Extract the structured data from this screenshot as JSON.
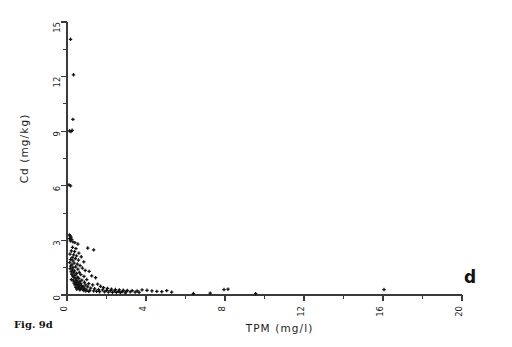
{
  "figure": {
    "caption": "Fig. 9d",
    "panel_letter": "d"
  },
  "chart_data": {
    "type": "scatter",
    "title": "",
    "xlabel": "TPM  (mg/l)",
    "ylabel": "Cd  (mg/kg)",
    "xlim": [
      0,
      20
    ],
    "ylim": [
      0,
      15
    ],
    "x_major_ticks": [
      0,
      4,
      8,
      12,
      16,
      20
    ],
    "x_minor_ticks": [
      2,
      6,
      10,
      14,
      18
    ],
    "y_major_ticks": [
      0,
      3,
      6,
      9,
      12,
      15
    ],
    "y_minor_ticks": [
      1.5,
      4.5,
      7.5,
      10.5,
      13.5
    ],
    "x_tick_labels": [
      "0",
      "4",
      "8",
      "12",
      "16",
      "20"
    ],
    "y_tick_labels": [
      "0",
      "3",
      "6",
      "9",
      "12",
      "15"
    ],
    "tick_label_rotation": 90,
    "grid": false,
    "legend": null,
    "marker": "cross",
    "marker_color": "#111111",
    "points": [
      [
        0.18,
        14.05
      ],
      [
        0.33,
        12.1
      ],
      [
        0.3,
        9.65
      ],
      [
        0.12,
        9.02
      ],
      [
        0.2,
        8.98
      ],
      [
        0.26,
        9.05
      ],
      [
        0.1,
        6.05
      ],
      [
        0.18,
        6.0
      ],
      [
        0.12,
        3.3
      ],
      [
        0.16,
        3.25
      ],
      [
        0.2,
        3.18
      ],
      [
        0.13,
        3.1
      ],
      [
        0.24,
        3.05
      ],
      [
        0.17,
        2.98
      ],
      [
        0.3,
        2.92
      ],
      [
        0.4,
        2.88
      ],
      [
        0.55,
        2.8
      ],
      [
        0.28,
        2.62
      ],
      [
        0.45,
        2.55
      ],
      [
        1.05,
        2.58
      ],
      [
        1.35,
        2.48
      ],
      [
        0.22,
        2.42
      ],
      [
        0.38,
        2.38
      ],
      [
        0.6,
        2.3
      ],
      [
        0.15,
        2.25
      ],
      [
        0.33,
        2.2
      ],
      [
        0.48,
        2.15
      ],
      [
        0.72,
        2.1
      ],
      [
        0.26,
        2.05
      ],
      [
        0.42,
        2.0
      ],
      [
        0.18,
        1.95
      ],
      [
        0.58,
        1.92
      ],
      [
        0.3,
        1.88
      ],
      [
        0.85,
        1.82
      ],
      [
        0.14,
        1.78
      ],
      [
        0.36,
        1.75
      ],
      [
        0.52,
        1.7
      ],
      [
        0.25,
        1.66
      ],
      [
        0.66,
        1.62
      ],
      [
        0.19,
        1.58
      ],
      [
        0.44,
        1.55
      ],
      [
        0.31,
        1.5
      ],
      [
        0.78,
        1.48
      ],
      [
        0.16,
        1.45
      ],
      [
        0.55,
        1.42
      ],
      [
        0.27,
        1.38
      ],
      [
        0.92,
        1.35
      ],
      [
        0.38,
        1.32
      ],
      [
        0.21,
        1.28
      ],
      [
        0.62,
        1.25
      ],
      [
        0.34,
        1.22
      ],
      [
        0.48,
        1.18
      ],
      [
        1.12,
        1.3
      ],
      [
        0.24,
        1.15
      ],
      [
        0.7,
        1.12
      ],
      [
        0.4,
        1.08
      ],
      [
        0.29,
        1.05
      ],
      [
        0.86,
        1.02
      ],
      [
        0.52,
        0.98
      ],
      [
        0.35,
        0.95
      ],
      [
        1.25,
        1.05
      ],
      [
        0.6,
        0.92
      ],
      [
        0.44,
        0.88
      ],
      [
        0.22,
        0.85
      ],
      [
        0.75,
        0.82
      ],
      [
        0.5,
        0.8
      ],
      [
        0.32,
        0.78
      ],
      [
        1.0,
        0.85
      ],
      [
        0.65,
        0.75
      ],
      [
        0.42,
        0.72
      ],
      [
        0.88,
        0.7
      ],
      [
        0.55,
        0.68
      ],
      [
        0.36,
        0.65
      ],
      [
        1.45,
        0.95
      ],
      [
        0.7,
        0.62
      ],
      [
        0.48,
        0.6
      ],
      [
        1.1,
        0.62
      ],
      [
        0.6,
        0.58
      ],
      [
        0.4,
        0.55
      ],
      [
        0.95,
        0.55
      ],
      [
        0.72,
        0.52
      ],
      [
        0.52,
        0.5
      ],
      [
        1.3,
        0.55
      ],
      [
        0.82,
        0.48
      ],
      [
        0.62,
        0.45
      ],
      [
        1.55,
        0.6
      ],
      [
        0.45,
        0.42
      ],
      [
        1.05,
        0.45
      ],
      [
        0.75,
        0.4
      ],
      [
        0.58,
        0.38
      ],
      [
        1.7,
        0.48
      ],
      [
        0.9,
        0.36
      ],
      [
        0.68,
        0.34
      ],
      [
        1.2,
        0.38
      ],
      [
        0.5,
        0.32
      ],
      [
        1.85,
        0.4
      ],
      [
        0.8,
        0.3
      ],
      [
        1.4,
        0.34
      ],
      [
        0.65,
        0.28
      ],
      [
        2.05,
        0.36
      ],
      [
        1.0,
        0.27
      ],
      [
        1.6,
        0.3
      ],
      [
        0.85,
        0.25
      ],
      [
        2.25,
        0.32
      ],
      [
        1.15,
        0.24
      ],
      [
        1.8,
        0.28
      ],
      [
        0.95,
        0.22
      ],
      [
        2.45,
        0.3
      ],
      [
        1.35,
        0.22
      ],
      [
        2.0,
        0.26
      ],
      [
        1.1,
        0.2
      ],
      [
        2.65,
        0.28
      ],
      [
        1.5,
        0.2
      ],
      [
        2.2,
        0.24
      ],
      [
        2.85,
        0.26
      ],
      [
        1.65,
        0.18
      ],
      [
        2.4,
        0.22
      ],
      [
        3.05,
        0.25
      ],
      [
        1.9,
        0.17
      ],
      [
        2.6,
        0.2
      ],
      [
        3.3,
        0.24
      ],
      [
        2.1,
        0.16
      ],
      [
        2.8,
        0.19
      ],
      [
        3.55,
        0.22
      ],
      [
        2.3,
        0.15
      ],
      [
        3.0,
        0.18
      ],
      [
        3.8,
        0.28
      ],
      [
        2.5,
        0.14
      ],
      [
        3.2,
        0.17
      ],
      [
        4.05,
        0.26
      ],
      [
        2.7,
        0.13
      ],
      [
        3.45,
        0.16
      ],
      [
        4.3,
        0.22
      ],
      [
        2.95,
        0.12
      ],
      [
        3.65,
        0.15
      ],
      [
        4.55,
        0.2
      ],
      [
        4.8,
        0.18
      ],
      [
        5.05,
        0.24
      ],
      [
        5.3,
        0.16
      ],
      [
        6.4,
        0.08
      ],
      [
        7.25,
        0.1
      ],
      [
        7.95,
        0.3
      ],
      [
        8.15,
        0.32
      ],
      [
        9.55,
        0.07
      ],
      [
        16.05,
        0.3
      ]
    ]
  }
}
